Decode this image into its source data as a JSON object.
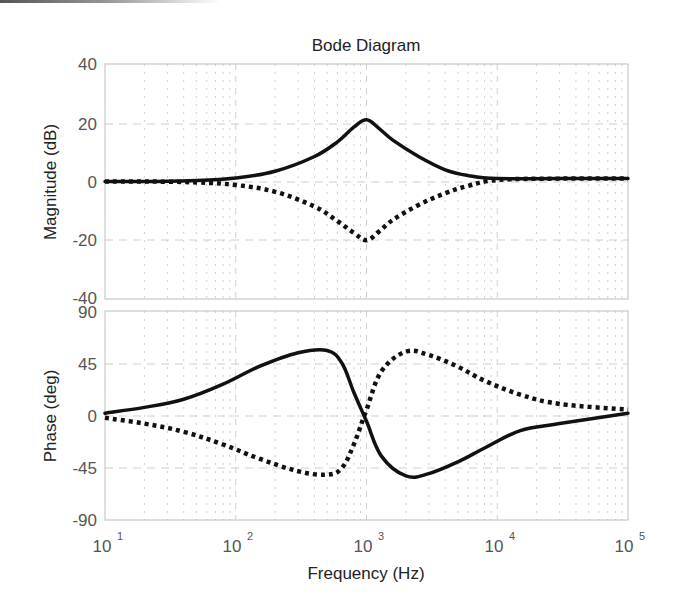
{
  "chart_data": [
    {
      "type": "line",
      "panel": "magnitude",
      "title": "Bode Diagram",
      "xlabel": "Frequency  (Hz)",
      "ylabel": "Magnitude (dB)",
      "xscale": "log",
      "xlim": [
        10,
        100000
      ],
      "ylim": [
        -40,
        40
      ],
      "yticks": [
        "40",
        "20",
        "0",
        "-20",
        "-40"
      ],
      "grid": true,
      "series": [
        {
          "name": "solid",
          "style": "solid",
          "x": [
            10,
            20,
            50,
            100,
            200,
            400,
            600,
            800,
            1000,
            1250,
            1600,
            2500,
            4000,
            6000,
            10000,
            30000,
            100000
          ],
          "y": [
            0,
            0,
            0.3,
            1.2,
            3.5,
            8.5,
            13.5,
            18.5,
            21,
            18,
            14,
            8.5,
            4,
            2,
            1,
            1,
            1
          ]
        },
        {
          "name": "dotted",
          "style": "dotted",
          "x": [
            10,
            20,
            50,
            100,
            200,
            400,
            600,
            800,
            1000,
            1250,
            1600,
            2500,
            4000,
            6000,
            10000,
            30000,
            100000
          ],
          "y": [
            0,
            0,
            -0.3,
            -1.2,
            -3.5,
            -8.5,
            -13.5,
            -17.5,
            -20,
            -17,
            -13,
            -8,
            -4,
            -1.5,
            0.5,
            1,
            1
          ]
        }
      ]
    },
    {
      "type": "line",
      "panel": "phase",
      "xlabel": "Frequency  (Hz)",
      "ylabel": "Phase (deg)",
      "xscale": "log",
      "xlim": [
        10,
        100000
      ],
      "ylim": [
        -90,
        90
      ],
      "yticks": [
        "90",
        "45",
        "0",
        "-45",
        "-90"
      ],
      "xticks": [
        "10^1",
        "10^2",
        "10^3",
        "10^4",
        "10^5"
      ],
      "grid": true,
      "series": [
        {
          "name": "solid",
          "style": "solid",
          "x": [
            10,
            20,
            40,
            80,
            150,
            300,
            500,
            650,
            800,
            1000,
            1300,
            2000,
            3000,
            5000,
            8000,
            15000,
            30000,
            100000
          ],
          "y": [
            2,
            7,
            14,
            27,
            42,
            54,
            56,
            45,
            20,
            -5,
            -35,
            -52,
            -50,
            -40,
            -28,
            -13,
            -7,
            2
          ]
        },
        {
          "name": "dotted",
          "style": "dotted",
          "x": [
            10,
            20,
            40,
            80,
            150,
            300,
            500,
            650,
            800,
            1000,
            1300,
            2000,
            3000,
            5000,
            8000,
            15000,
            30000,
            100000
          ],
          "y": [
            -2,
            -7,
            -14,
            -25,
            -37,
            -48,
            -51,
            -45,
            -25,
            5,
            38,
            55,
            52,
            42,
            30,
            18,
            10,
            5
          ]
        }
      ]
    }
  ],
  "labels": {
    "title": "Bode Diagram",
    "xlabel": "Frequency  (Hz)",
    "ylabel_mag": "Magnitude (dB)",
    "ylabel_phase": "Phase (deg)",
    "mag_ticks": [
      "40",
      "20",
      "0",
      "-20",
      "-40"
    ],
    "phase_ticks": [
      "90",
      "45",
      "0",
      "-45",
      "-90"
    ],
    "x_base": "10",
    "x_exps": [
      "1",
      "2",
      "3",
      "4",
      "5"
    ]
  },
  "colors": {
    "curve": "#111111",
    "grid": "#cfcfcf",
    "frame": "#bdbdbd",
    "text": "#555555"
  }
}
